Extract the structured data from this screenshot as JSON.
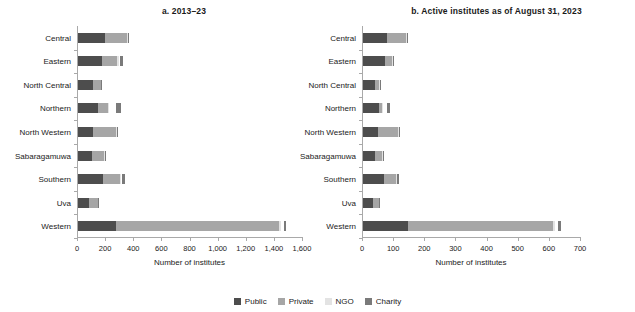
{
  "legend": {
    "position": "bottom-center",
    "entries": [
      {
        "label": "Public",
        "color": "#4d4d4d"
      },
      {
        "label": "Private",
        "color": "#a6a6a6"
      },
      {
        "label": "NGO",
        "color": "#e3e3e3"
      },
      {
        "label": "Charity",
        "color": "#7a7a7a"
      }
    ]
  },
  "chart_data": [
    {
      "type": "bar",
      "orientation": "horizontal",
      "stacked": true,
      "title": "a. 2013–23",
      "xlabel": "Number of institutes",
      "ylabel": "",
      "xlim": [
        0,
        1600
      ],
      "xticks": [
        0,
        200,
        400,
        600,
        800,
        1000,
        1200,
        1400,
        1600
      ],
      "xtick_labels": [
        "0",
        "200",
        "400",
        "600",
        "800",
        "1,000",
        "1,200",
        "1,400",
        "1,600"
      ],
      "grid": false,
      "categories": [
        "Central",
        "Eastern",
        "North Central",
        "Northern",
        "North Western",
        "Sabaragamuwa",
        "Southern",
        "Uva",
        "Western"
      ],
      "series": [
        {
          "name": "Public",
          "values": [
            190,
            170,
            105,
            145,
            110,
            100,
            175,
            80,
            270
          ]
        },
        {
          "name": "Private",
          "values": [
            155,
            110,
            55,
            65,
            160,
            85,
            125,
            60,
            1160
          ]
        },
        {
          "name": "NGO",
          "values": [
            10,
            8,
            4,
            5,
            8,
            5,
            8,
            4,
            15
          ]
        },
        {
          "name": "Charity",
          "values": [
            6,
            20,
            3,
            35,
            5,
            5,
            18,
            4,
            15
          ]
        }
      ],
      "charity_gap": {
        "Northern": 55,
        "Eastern": 12,
        "Western": 18,
        "Southern": 6,
        "North Western": 0,
        "Central": 0,
        "North Central": 0,
        "Sabaragamuwa": 0,
        "Uva": 0
      }
    },
    {
      "type": "bar",
      "orientation": "horizontal",
      "stacked": true,
      "title": "b. Active institutes as of August 31, 2023",
      "xlabel": "Number of institutes",
      "ylabel": "",
      "xlim": [
        0,
        700
      ],
      "xticks": [
        0,
        100,
        200,
        300,
        400,
        500,
        600,
        700
      ],
      "xtick_labels": [
        "0",
        "100",
        "200",
        "300",
        "400",
        "500",
        "600",
        "700"
      ],
      "grid": false,
      "categories": [
        "Central",
        "Eastern",
        "North Central",
        "Northern",
        "North Western",
        "Sabaragamuwa",
        "Southern",
        "Uva",
        "Western"
      ],
      "series": [
        {
          "name": "Public",
          "values": [
            78,
            72,
            38,
            52,
            48,
            40,
            68,
            32,
            145
          ]
        },
        {
          "name": "Private",
          "values": [
            60,
            20,
            14,
            10,
            65,
            22,
            38,
            18,
            465
          ]
        },
        {
          "name": "NGO",
          "values": [
            4,
            3,
            2,
            2,
            4,
            2,
            3,
            2,
            6
          ]
        },
        {
          "name": "Charity",
          "values": [
            3,
            6,
            2,
            9,
            2,
            2,
            6,
            2,
            9
          ]
        }
      ],
      "charity_gap": {
        "Northern": 14,
        "Eastern": 0,
        "Western": 10,
        "Southern": 0,
        "North Western": 0,
        "Central": 0,
        "North Central": 0,
        "Sabaragamuwa": 0,
        "Uva": 0
      }
    }
  ]
}
